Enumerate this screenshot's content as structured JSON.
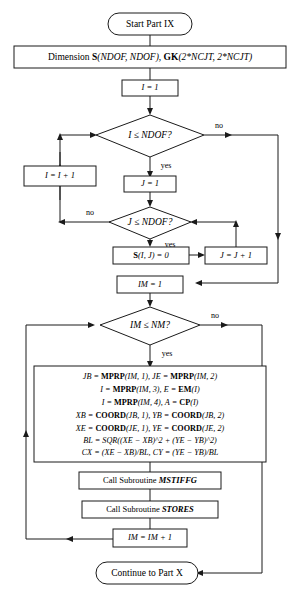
{
  "diagram": {
    "stroke_color": "#1a1a1a",
    "background_color": "#ffffff"
  },
  "nodes": {
    "start": {
      "label": "Start Part IX",
      "type": "terminator"
    },
    "dimension": {
      "type": "process",
      "prefix": "Dimension ",
      "s_name": "S",
      "s_args": "(NDOF, NDOF), ",
      "gk_name": "GK",
      "gk_args": "(2*NCJT, 2*NCJT)"
    },
    "i_init": {
      "label": "I = 1",
      "type": "process"
    },
    "dec_i": {
      "label": "I ≤ NDOF?",
      "type": "decision"
    },
    "i_incr": {
      "label": "I = I + 1",
      "type": "process"
    },
    "j_init": {
      "label": "J = 1",
      "type": "process"
    },
    "dec_j": {
      "label": "J ≤ NDOF?",
      "type": "decision"
    },
    "s_zero": {
      "type": "process",
      "name": "S",
      "rest": "(I, J) = 0"
    },
    "j_incr": {
      "label": "J = J + 1",
      "type": "process"
    },
    "im_init": {
      "label": "IM = 1",
      "type": "process"
    },
    "dec_im": {
      "label": "IM ≤ NM?",
      "type": "decision"
    },
    "compute": {
      "type": "process",
      "lines": [
        [
          {
            "text": "JB = ",
            "style": "italic"
          },
          {
            "text": "MPRP",
            "style": "bold"
          },
          {
            "text": "(IM, 1), JE = ",
            "style": "italic"
          },
          {
            "text": "MPRP",
            "style": "bold"
          },
          {
            "text": "(IM, 2)",
            "style": "italic"
          }
        ],
        [
          {
            "text": "I = ",
            "style": "italic"
          },
          {
            "text": "MPRP",
            "style": "bold"
          },
          {
            "text": "(IM, 3), E = ",
            "style": "italic"
          },
          {
            "text": "EM",
            "style": "bold"
          },
          {
            "text": "(I)",
            "style": "italic"
          }
        ],
        [
          {
            "text": "I = ",
            "style": "italic"
          },
          {
            "text": "MPRP",
            "style": "bold"
          },
          {
            "text": "(IM, 4), A = ",
            "style": "italic"
          },
          {
            "text": "CP",
            "style": "bold"
          },
          {
            "text": "(I)",
            "style": "italic"
          }
        ],
        [
          {
            "text": "XB = ",
            "style": "italic"
          },
          {
            "text": "COORD",
            "style": "bold"
          },
          {
            "text": "(JB, 1), YB = ",
            "style": "italic"
          },
          {
            "text": "COORD",
            "style": "bold"
          },
          {
            "text": "(JB, 2)",
            "style": "italic"
          }
        ],
        [
          {
            "text": "XE = ",
            "style": "italic"
          },
          {
            "text": "COORD",
            "style": "bold"
          },
          {
            "text": "(JE, 1), YE = ",
            "style": "italic"
          },
          {
            "text": "COORD",
            "style": "bold"
          },
          {
            "text": "(JE, 2)",
            "style": "italic"
          }
        ],
        [
          {
            "text": "BL = ",
            "style": "italic"
          },
          {
            "text": "SQR((XE − XB)^2 + (YE − YB)^2)",
            "style": "italic"
          }
        ],
        [
          {
            "text": "CX = (XE − XB)/BL, CY = (YE − YB)/BL",
            "style": "italic"
          }
        ]
      ]
    },
    "call_mstiffg": {
      "type": "process",
      "prefix": "Call Subroutine ",
      "name": "MSTIFFG"
    },
    "call_stores": {
      "type": "process",
      "prefix": "Call Subroutine ",
      "name": "STORES"
    },
    "im_incr": {
      "label": "IM = IM + 1",
      "type": "process"
    },
    "end": {
      "label": "Continue to Part X",
      "type": "terminator"
    }
  },
  "edge_labels": {
    "i_no": "no",
    "i_yes": "yes",
    "j_no": "no",
    "j_yes": "yes",
    "im_no": "no",
    "im_yes": "yes"
  }
}
